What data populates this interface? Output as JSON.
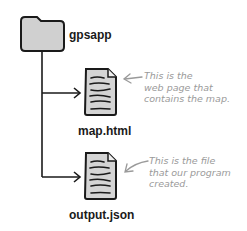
{
  "diagram": {
    "folder": {
      "name": "gpsapp",
      "icon": "folder-icon"
    },
    "files": [
      {
        "name": "map.html",
        "icon": "document-icon",
        "annotation": "This is the\nweb page that\ncontains the map."
      },
      {
        "name": "output.json",
        "icon": "document-icon",
        "annotation": "This is the file\nthat our program\ncreated."
      }
    ],
    "colors": {
      "line": "#1a1a1a",
      "icon_fill": "#d0d0d0",
      "annotation": "#9a9a9a"
    }
  }
}
